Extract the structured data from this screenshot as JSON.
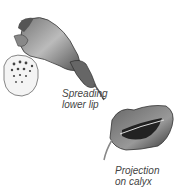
{
  "illustration": {
    "subject": "flower with spreading lower lip and calyx",
    "labels": {
      "lower_lip": [
        "Spreading",
        "lower lip"
      ],
      "calyx": [
        "Projection",
        "on calyx"
      ]
    }
  }
}
